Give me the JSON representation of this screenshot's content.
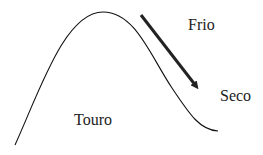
{
  "labels": {
    "frio": "Frio",
    "seco": "Seco",
    "touro": "Touro"
  },
  "colors": {
    "line": "#111111",
    "arrow": "#222222",
    "text": "#222222"
  }
}
